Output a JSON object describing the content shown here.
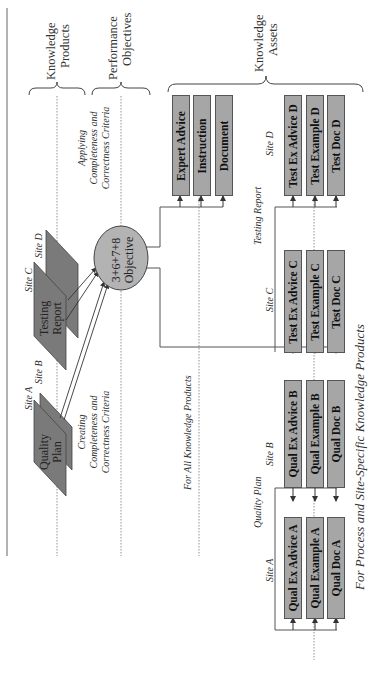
{
  "headers": {
    "knowledge_products": [
      "Knowledge",
      "Products"
    ],
    "performance_objectives": [
      "Performance",
      "Objectives"
    ],
    "knowledge_assets": [
      "Knowledge",
      "Assets"
    ]
  },
  "products": {
    "quality_plan": [
      "Quality",
      "Plan"
    ],
    "testing_report": [
      "Testing",
      "Report"
    ],
    "site_a": "Site A",
    "site_b": "Site B",
    "site_c": "Site C",
    "site_d": "Site D"
  },
  "objective": {
    "formula": "3+6+7+8",
    "label": "Objective"
  },
  "annotations": {
    "creating": [
      "Creating",
      "Completeness and",
      "Correctness Criteria"
    ],
    "applying": [
      "Applying",
      "Completeness and",
      "Correctness Criteria"
    ],
    "for_all": "For All Knowledge Products",
    "for_process": "For Process and Site-Specific Knowledge Products",
    "quality_plan_group": "Quality Plan",
    "testing_report_group": "Testing Report",
    "site_a": "Site A",
    "site_b": "Site B",
    "site_c": "Site C",
    "site_d": "Site D"
  },
  "general_assets": [
    "Expert Advice",
    "Instruction",
    "Document"
  ],
  "site_assets": {
    "A": [
      "Qual Ex Advice A",
      "Qual Example A",
      "Qual Doc A"
    ],
    "B": [
      "Qual Ex Advice B",
      "Qual Example B",
      "Qual Doc B"
    ],
    "C": [
      "Test Ex Advice C",
      "Test Example C",
      "Test Doc C"
    ],
    "D": [
      "Test Ex Advice D",
      "Test Example D",
      "Test Doc D"
    ]
  },
  "colors": {
    "box_fill": "#a6a6a6",
    "doc_fill": "#7a7a7a",
    "circle_fill": "#b3b3b3"
  }
}
